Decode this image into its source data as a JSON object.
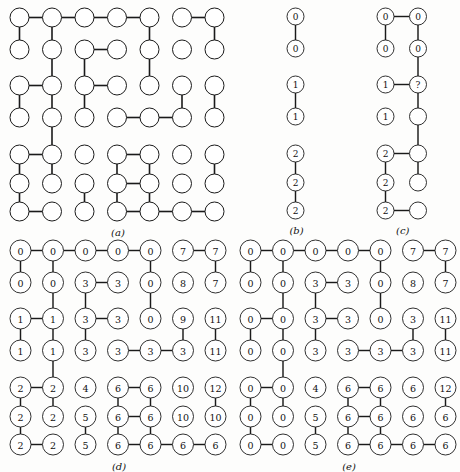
{
  "figure": {
    "background_color": "#fdfdfc",
    "stroke_color": "#1a1a1a",
    "node_fill": "#ffffff",
    "width": 450,
    "height": 461
  },
  "panels": [
    {
      "id": "a",
      "caption": "(a)",
      "description": "plain graph of empty circles on a 7x7 grid with edges",
      "origin_x": 8,
      "origin_y": 6,
      "col_step": 32.5,
      "row_positions": [
        9,
        41,
        77,
        109,
        146,
        175,
        203
      ],
      "radius": 9.5,
      "font_size": 0,
      "stroke_width": 1.0,
      "rows": 7,
      "cols": 7,
      "labels": [
        [
          "",
          "",
          "",
          "",
          "",
          "",
          ""
        ],
        [
          "",
          "",
          "",
          "",
          "",
          "",
          ""
        ],
        [
          "",
          "",
          "",
          "",
          "",
          "",
          ""
        ],
        [
          "",
          "",
          "",
          "",
          "",
          "",
          ""
        ],
        [
          "",
          "",
          "",
          "",
          "",
          "",
          ""
        ],
        [
          "",
          "",
          "",
          "",
          "",
          "",
          ""
        ],
        [
          "",
          "",
          "",
          "",
          "",
          "",
          ""
        ]
      ],
      "h_edges": [
        [
          0,
          0
        ],
        [
          0,
          1
        ],
        [
          0,
          2
        ],
        [
          0,
          3
        ],
        [
          0,
          5
        ],
        [
          1,
          2
        ],
        [
          2,
          0
        ],
        [
          2,
          2
        ],
        [
          3,
          3
        ],
        [
          3,
          4
        ],
        [
          4,
          0
        ],
        [
          4,
          3
        ],
        [
          5,
          3
        ],
        [
          6,
          0
        ],
        [
          6,
          3
        ],
        [
          6,
          4
        ],
        [
          6,
          5
        ]
      ],
      "v_edges": [
        [
          0,
          0
        ],
        [
          0,
          1
        ],
        [
          0,
          4
        ],
        [
          0,
          6
        ],
        [
          1,
          1
        ],
        [
          1,
          2
        ],
        [
          1,
          4
        ],
        [
          2,
          0
        ],
        [
          2,
          1
        ],
        [
          2,
          2
        ],
        [
          2,
          5
        ],
        [
          2,
          6
        ],
        [
          3,
          1
        ],
        [
          4,
          0
        ],
        [
          4,
          1
        ],
        [
          4,
          3
        ],
        [
          4,
          4
        ],
        [
          4,
          6
        ],
        [
          5,
          0
        ],
        [
          5,
          2
        ],
        [
          5,
          3
        ],
        [
          5,
          4
        ]
      ]
    },
    {
      "id": "b",
      "caption": "(b)",
      "description": "single column of labelled circles, provisional labels",
      "origin_x": 285,
      "origin_y": 6,
      "col_step": 32.5,
      "row_positions": [
        9,
        41,
        77,
        109,
        146,
        175,
        203
      ],
      "radius": 8.5,
      "font_size": 9,
      "stroke_width": 0.9,
      "rows": 7,
      "cols": 1,
      "labels": [
        [
          "0"
        ],
        [
          "0"
        ],
        [
          "1"
        ],
        [
          "1"
        ],
        [
          "2"
        ],
        [
          "2"
        ],
        [
          "2"
        ]
      ],
      "h_edges": [],
      "v_edges": [
        [
          0,
          0
        ],
        [
          2,
          0
        ],
        [
          4,
          0
        ],
        [
          5,
          0
        ]
      ]
    },
    {
      "id": "c",
      "caption": "(c)",
      "description": "two column graph with a query node marked ?",
      "origin_x": 375,
      "origin_y": 6,
      "col_step": 32.5,
      "row_positions": [
        9,
        41,
        77,
        109,
        146,
        175,
        203
      ],
      "radius": 8.5,
      "font_size": 9,
      "stroke_width": 0.9,
      "rows": 7,
      "cols": 2,
      "labels": [
        [
          "0",
          "0"
        ],
        [
          "0",
          "0"
        ],
        [
          "1",
          "?"
        ],
        [
          "1",
          ""
        ],
        [
          "2",
          ""
        ],
        [
          "2",
          ""
        ],
        [
          "2",
          ""
        ]
      ],
      "h_edges": [
        [
          0,
          0
        ],
        [
          2,
          0
        ],
        [
          4,
          0
        ],
        [
          6,
          0
        ]
      ],
      "v_edges": [
        [
          0,
          0
        ],
        [
          0,
          1
        ],
        [
          1,
          1
        ],
        [
          2,
          1
        ],
        [
          3,
          1
        ],
        [
          4,
          0
        ],
        [
          5,
          0
        ],
        [
          4,
          1
        ]
      ]
    },
    {
      "id": "d",
      "caption": "(d)",
      "description": "7x7 grid with provisional component labels before merging",
      "origin_x": 8,
      "origin_y": 238,
      "col_step": 32.5,
      "row_positions": [
        9,
        41,
        77,
        109,
        146,
        175,
        203
      ],
      "radius": 10.5,
      "font_size": 9.5,
      "stroke_width": 0.9,
      "rows": 7,
      "cols": 7,
      "labels": [
        [
          "0",
          "0",
          "0",
          "0",
          "0",
          "7",
          "7"
        ],
        [
          "0",
          "0",
          "3",
          "3",
          "0",
          "8",
          "7"
        ],
        [
          "1",
          "1",
          "3",
          "3",
          "0",
          "9",
          "11"
        ],
        [
          "1",
          "1",
          "3",
          "3",
          "3",
          "3",
          "11"
        ],
        [
          "2",
          "2",
          "4",
          "6",
          "6",
          "10",
          "12"
        ],
        [
          "2",
          "2",
          "5",
          "6",
          "6",
          "10",
          "10"
        ],
        [
          "2",
          "2",
          "5",
          "6",
          "6",
          "6",
          "6"
        ]
      ],
      "h_edges": [
        [
          0,
          0
        ],
        [
          0,
          1
        ],
        [
          0,
          2
        ],
        [
          0,
          3
        ],
        [
          0,
          5
        ],
        [
          1,
          2
        ],
        [
          2,
          0
        ],
        [
          2,
          2
        ],
        [
          3,
          3
        ],
        [
          3,
          4
        ],
        [
          4,
          0
        ],
        [
          4,
          3
        ],
        [
          5,
          3
        ],
        [
          6,
          0
        ],
        [
          6,
          3
        ],
        [
          6,
          4
        ],
        [
          6,
          5
        ]
      ],
      "v_edges": [
        [
          0,
          0
        ],
        [
          0,
          1
        ],
        [
          0,
          4
        ],
        [
          0,
          6
        ],
        [
          1,
          1
        ],
        [
          1,
          2
        ],
        [
          1,
          4
        ],
        [
          2,
          0
        ],
        [
          2,
          1
        ],
        [
          2,
          2
        ],
        [
          2,
          5
        ],
        [
          2,
          6
        ],
        [
          3,
          1
        ],
        [
          4,
          0
        ],
        [
          4,
          1
        ],
        [
          4,
          3
        ],
        [
          4,
          4
        ],
        [
          4,
          6
        ],
        [
          5,
          0
        ],
        [
          5,
          2
        ],
        [
          5,
          3
        ],
        [
          5,
          4
        ]
      ]
    },
    {
      "id": "e",
      "caption": "(e)",
      "description": "7x7 grid with final resolved component labels after merging",
      "origin_x": 238,
      "origin_y": 238,
      "col_step": 32.5,
      "row_positions": [
        9,
        41,
        77,
        109,
        146,
        175,
        203
      ],
      "radius": 10.5,
      "font_size": 9.5,
      "stroke_width": 0.9,
      "rows": 7,
      "cols": 7,
      "labels": [
        [
          "0",
          "0",
          "0",
          "0",
          "0",
          "7",
          "7"
        ],
        [
          "0",
          "0",
          "3",
          "3",
          "0",
          "8",
          "7"
        ],
        [
          "0",
          "0",
          "3",
          "3",
          "0",
          "3",
          "11"
        ],
        [
          "0",
          "0",
          "3",
          "3",
          "3",
          "3",
          "11"
        ],
        [
          "0",
          "0",
          "4",
          "6",
          "6",
          "6",
          "12"
        ],
        [
          "0",
          "0",
          "5",
          "6",
          "6",
          "6",
          "6"
        ],
        [
          "0",
          "0",
          "5",
          "6",
          "6",
          "6",
          "6"
        ]
      ],
      "h_edges": [
        [
          0,
          0
        ],
        [
          0,
          1
        ],
        [
          0,
          2
        ],
        [
          0,
          3
        ],
        [
          0,
          5
        ],
        [
          1,
          2
        ],
        [
          2,
          0
        ],
        [
          2,
          2
        ],
        [
          3,
          3
        ],
        [
          3,
          4
        ],
        [
          4,
          0
        ],
        [
          4,
          3
        ],
        [
          5,
          3
        ],
        [
          6,
          0
        ],
        [
          6,
          3
        ],
        [
          6,
          4
        ],
        [
          6,
          5
        ]
      ],
      "v_edges": [
        [
          0,
          0
        ],
        [
          0,
          1
        ],
        [
          0,
          4
        ],
        [
          0,
          6
        ],
        [
          1,
          1
        ],
        [
          1,
          2
        ],
        [
          1,
          4
        ],
        [
          2,
          0
        ],
        [
          2,
          1
        ],
        [
          2,
          2
        ],
        [
          2,
          5
        ],
        [
          2,
          6
        ],
        [
          3,
          1
        ],
        [
          4,
          0
        ],
        [
          4,
          1
        ],
        [
          4,
          3
        ],
        [
          4,
          4
        ],
        [
          4,
          6
        ],
        [
          5,
          0
        ],
        [
          5,
          2
        ],
        [
          5,
          3
        ],
        [
          5,
          4
        ]
      ]
    }
  ]
}
